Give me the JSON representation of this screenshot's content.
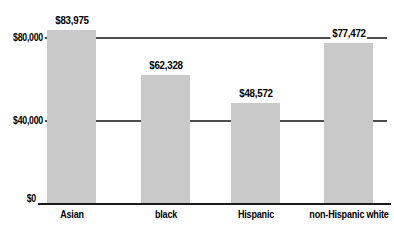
{
  "chart_data": {
    "type": "bar",
    "categories": [
      "Asian",
      "black",
      "Hispanic",
      "non-Hispanic white"
    ],
    "values": [
      83975,
      62328,
      48572,
      77472
    ],
    "value_labels": [
      "$83,975",
      "$62,328",
      "$48,572",
      "$77,472"
    ],
    "ytick_values": [
      0,
      40000,
      80000
    ],
    "ytick_labels": [
      "$0",
      "$40,000",
      "$80,000"
    ],
    "ylim": [
      0,
      88000
    ],
    "grid": "horizontal gridlines at 40000 and 80000",
    "legend": "none",
    "title": "",
    "xlabel": "",
    "ylabel": "",
    "bar_color": "#c9c9c9",
    "gridline_color": "#4d4d4d",
    "axis_color": "#1c1c1c",
    "text_color": "#000000",
    "background": "#ffffff"
  }
}
